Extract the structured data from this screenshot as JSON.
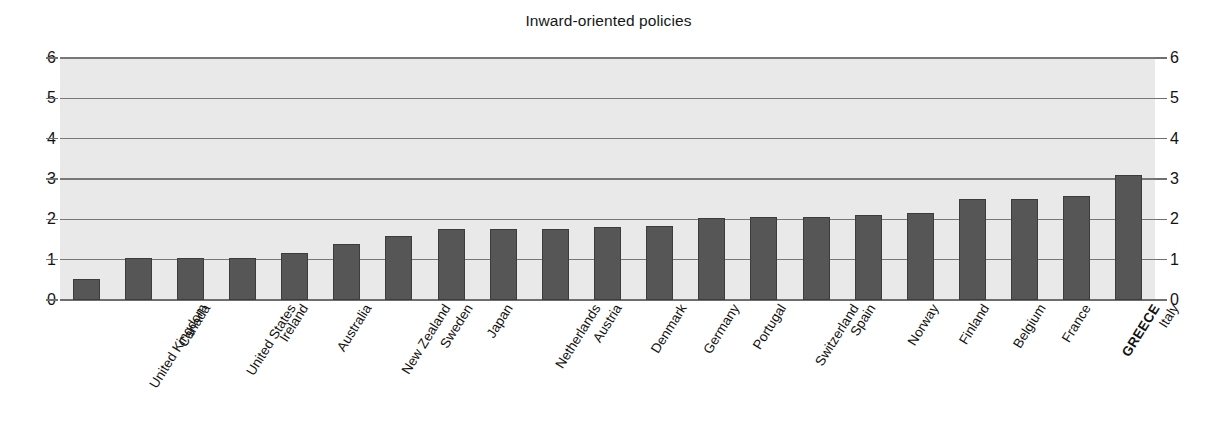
{
  "chart_data": {
    "type": "bar",
    "title": "Inward-oriented policies",
    "xlabel": "",
    "ylabel": "",
    "ylim": [
      0,
      6
    ],
    "yticks": [
      0,
      1,
      2,
      3,
      4,
      5,
      6
    ],
    "ytick_labels": [
      "0",
      "1",
      "2",
      "3",
      "4",
      "5",
      "6"
    ],
    "grid": true,
    "legend": "none",
    "dual_y_axis": true,
    "highlighted_category": "GREECE",
    "categories": [
      "United Kingdom",
      "Canada",
      "United States",
      "Ireland",
      "Australia",
      "New Zealand",
      "Sweden",
      "Japan",
      "Netherlands",
      "Austria",
      "Denmark",
      "Germany",
      "Portugal",
      "Switzerland",
      "Spain",
      "Norway",
      "Finland",
      "Belgium",
      "France",
      "GREECE",
      "Italy"
    ],
    "values": [
      0.52,
      1.05,
      1.05,
      1.05,
      1.17,
      1.38,
      1.58,
      1.75,
      1.75,
      1.76,
      1.8,
      1.84,
      2.03,
      2.06,
      2.06,
      2.11,
      2.16,
      2.5,
      2.51,
      2.58,
      3.09
    ],
    "colors": {
      "bar_fill": "#565656",
      "bar_edge": "#3c3c3c",
      "plot_background": "#e9e9e9",
      "gridline": "#787878",
      "page_background": "#ffffff",
      "text": "#111111"
    }
  }
}
